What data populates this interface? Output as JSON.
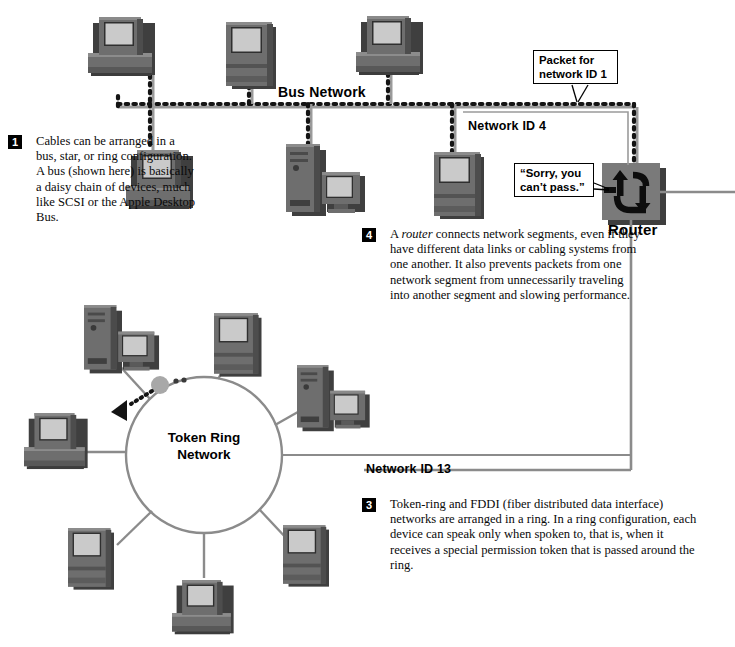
{
  "diagram": {
    "colors": {
      "device_body": "#767676",
      "device_dark": "#4a4a4a",
      "device_screen": "#c9c9c9",
      "line_gray": "#8b8b8b",
      "dotted_black": "#111111",
      "router_fill": "#7a7a7a",
      "token_gray": "#a8a8a8",
      "background": "#ffffff"
    }
  },
  "labels": {
    "bus_network": "Bus Network",
    "network_id_4": "Network ID 4",
    "network_id_13": "Network ID 13",
    "router": "Router",
    "token_ring": "Token Ring\nNetwork"
  },
  "callouts": {
    "packet": "Packet for\nnetwork ID 1",
    "sorry": "“Sorry, you\ncan’t pass.”"
  },
  "notes": [
    {
      "number": "1",
      "text": "Cables can be arranged in a bus, star, or ring configuration. A bus (shown here) is basically a daisy chain of devices, much like SCSI or the Apple Desktop Bus."
    },
    {
      "number": "4",
      "text_before": "A ",
      "emphasis": "router",
      "text_after": " connects network segments, even if they have different data links or cabling systems from one another. It also prevents packets from one network segment from unnecessarily traveling into another segment and slowing performance."
    },
    {
      "number": "3",
      "text": "Token-ring and FDDI (fiber distributed data interface) networks are arranged in a ring. In a ring configuration, each device can speak only when spoken to, that is, when it receives a special permission token that is passed around the ring."
    }
  ],
  "devices": {
    "bus_top": [
      "desktop-computer",
      "all-in-one-computer",
      "desktop-computer"
    ],
    "bus_bottom": [
      "desktop-computer",
      "tower-and-monitor",
      "all-in-one-computer"
    ],
    "ring": [
      "tower-and-monitor",
      "all-in-one-computer",
      "tower-and-monitor",
      "all-in-one-computer",
      "all-in-one-computer",
      "all-in-one-computer",
      "desktop-computer"
    ]
  }
}
